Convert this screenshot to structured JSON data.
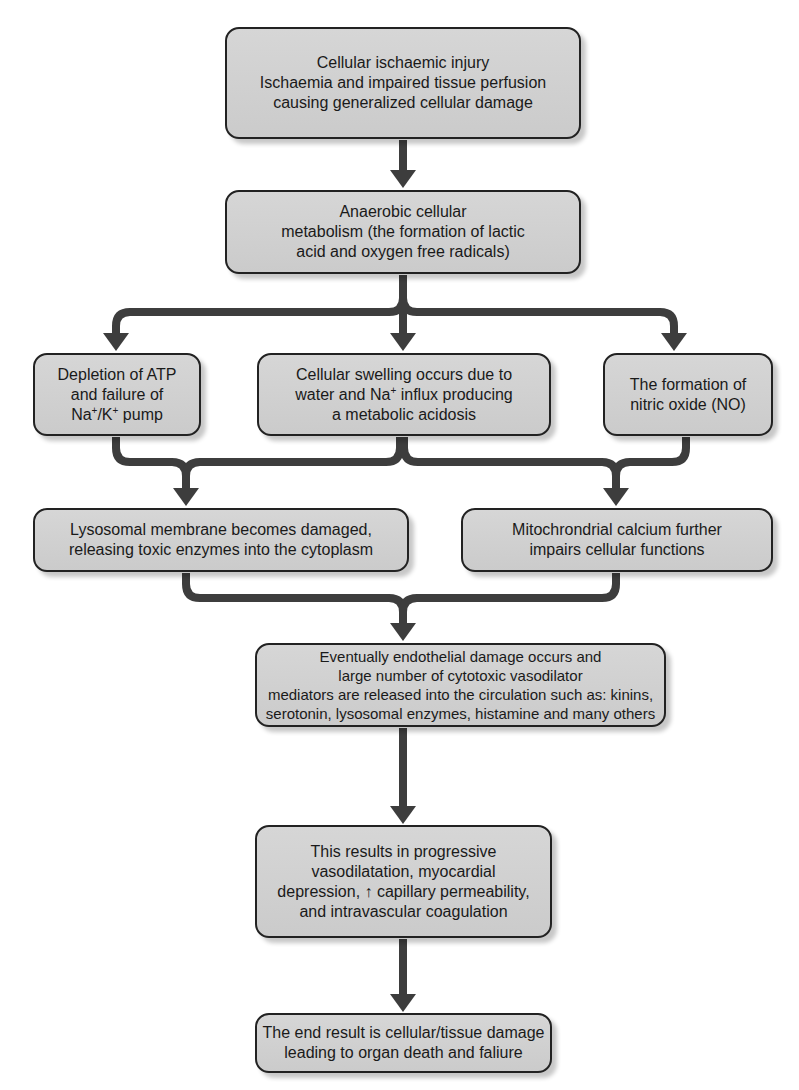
{
  "diagram": {
    "type": "flowchart",
    "arrow_color": "#3d3d3d",
    "box_fill": "#cfcfcf",
    "box_border": "#222222",
    "nodes": {
      "ischaemic_injury": {
        "lines": [
          "Cellular ischaemic injury",
          "Ischaemia and impaired tissue perfusion",
          "causing generalized cellular damage"
        ]
      },
      "anaerobic_metabolism": {
        "lines": [
          "Anaerobic cellular",
          "metabolism (the formation of lactic",
          "acid and oxygen free radicals)"
        ]
      },
      "atp_depletion": {
        "lines": [
          "Depletion of ATP",
          "and failure of"
        ],
        "line3_parts": [
          "Na",
          "+",
          "/K",
          "+",
          " pump"
        ]
      },
      "cellular_swelling": {
        "line1": "Cellular swelling occurs due to",
        "line2_parts": [
          "water and Na",
          "+",
          " influx producing"
        ],
        "line3": "a metabolic acidosis"
      },
      "nitric_oxide": {
        "lines": [
          "The formation of",
          "nitric oxide (NO)"
        ]
      },
      "lysosomal_damage": {
        "lines": [
          "Lysosomal membrane becomes damaged,",
          "releasing toxic enzymes into the cytoplasm"
        ]
      },
      "mitochondrial_calcium": {
        "lines": [
          "Mitochrondrial calcium further",
          "impairs cellular functions"
        ]
      },
      "endothelial_damage": {
        "lines": [
          "Eventually endothelial damage occurs and",
          "large number of cytotoxic vasodilator",
          "mediators are released into the circulation such as: kinins,",
          "serotonin, lysosomal enzymes, histamine and many others"
        ]
      },
      "progressive_effects": {
        "lines": [
          "This results in progressive",
          "vasodilatation, myocardial",
          "depression, ↑ capillary permeability,",
          "and intravascular coagulation"
        ]
      },
      "end_result": {
        "lines": [
          "The end result is cellular/tissue damage",
          "leading to organ death and faliure"
        ]
      }
    },
    "edges": [
      {
        "from": "ischaemic_injury",
        "to": "anaerobic_metabolism"
      },
      {
        "from": "anaerobic_metabolism",
        "to": "atp_depletion"
      },
      {
        "from": "anaerobic_metabolism",
        "to": "cellular_swelling"
      },
      {
        "from": "anaerobic_metabolism",
        "to": "nitric_oxide"
      },
      {
        "from": "atp_depletion",
        "to": "lysosomal_damage"
      },
      {
        "from": "cellular_swelling",
        "to": "lysosomal_damage"
      },
      {
        "from": "cellular_swelling",
        "to": "mitochondrial_calcium"
      },
      {
        "from": "nitric_oxide",
        "to": "mitochondrial_calcium"
      },
      {
        "from": "lysosomal_damage",
        "to": "endothelial_damage"
      },
      {
        "from": "mitochondrial_calcium",
        "to": "endothelial_damage"
      },
      {
        "from": "endothelial_damage",
        "to": "progressive_effects"
      },
      {
        "from": "progressive_effects",
        "to": "end_result"
      }
    ]
  }
}
